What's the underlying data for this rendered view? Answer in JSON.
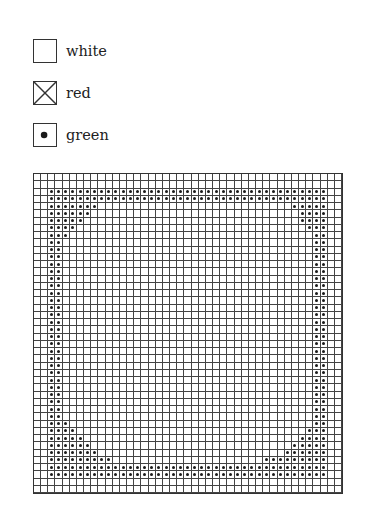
{
  "legend": {
    "items": [
      {
        "key": "white",
        "label": "white",
        "symbol": "empty"
      },
      {
        "key": "red",
        "label": "red",
        "symbol": "cross"
      },
      {
        "key": "green",
        "label": "green",
        "symbol": "dot"
      }
    ]
  },
  "grid": {
    "cols": 43,
    "rows": 44,
    "default_state": "white",
    "green_cells_by_row": {
      "2": [
        [
          2,
          40
        ]
      ],
      "3": [
        [
          2,
          40
        ]
      ],
      "4": [
        [
          2,
          8
        ],
        [
          36,
          40
        ]
      ],
      "5": [
        [
          2,
          7
        ],
        [
          37,
          40
        ]
      ],
      "6": [
        [
          2,
          6
        ],
        [
          37,
          40
        ]
      ],
      "7": [
        [
          2,
          5
        ],
        [
          38,
          40
        ]
      ],
      "8": [
        [
          2,
          4
        ],
        [
          39,
          40
        ]
      ],
      "9": [
        [
          2,
          3
        ],
        [
          39,
          40
        ]
      ],
      "10": [
        [
          2,
          3
        ],
        [
          39,
          40
        ]
      ],
      "11": [
        [
          2,
          3
        ],
        [
          39,
          40
        ]
      ],
      "12": [
        [
          2,
          3
        ],
        [
          39,
          40
        ]
      ],
      "13": [
        [
          2,
          3
        ],
        [
          39,
          40
        ]
      ],
      "14": [
        [
          2,
          3
        ],
        [
          39,
          40
        ]
      ],
      "15": [
        [
          2,
          3
        ],
        [
          39,
          40
        ]
      ],
      "16": [
        [
          2,
          3
        ],
        [
          39,
          40
        ]
      ],
      "17": [
        [
          2,
          3
        ],
        [
          39,
          40
        ]
      ],
      "18": [
        [
          2,
          3
        ],
        [
          39,
          40
        ]
      ],
      "19": [
        [
          2,
          3
        ],
        [
          39,
          40
        ]
      ],
      "20": [
        [
          2,
          3
        ],
        [
          39,
          40
        ]
      ],
      "21": [
        [
          2,
          3
        ],
        [
          39,
          40
        ]
      ],
      "22": [
        [
          2,
          3
        ],
        [
          39,
          40
        ]
      ],
      "23": [
        [
          2,
          3
        ],
        [
          39,
          40
        ]
      ],
      "24": [
        [
          2,
          3
        ],
        [
          39,
          40
        ]
      ],
      "25": [
        [
          2,
          3
        ],
        [
          39,
          40
        ]
      ],
      "26": [
        [
          2,
          3
        ],
        [
          39,
          40
        ]
      ],
      "27": [
        [
          2,
          3
        ],
        [
          39,
          40
        ]
      ],
      "28": [
        [
          2,
          3
        ],
        [
          39,
          40
        ]
      ],
      "29": [
        [
          2,
          3
        ],
        [
          39,
          40
        ]
      ],
      "30": [
        [
          2,
          3
        ],
        [
          39,
          40
        ]
      ],
      "31": [
        [
          2,
          3
        ],
        [
          39,
          40
        ]
      ],
      "32": [
        [
          2,
          3
        ],
        [
          39,
          40
        ]
      ],
      "33": [
        [
          2,
          3
        ],
        [
          39,
          40
        ]
      ],
      "34": [
        [
          2,
          4
        ],
        [
          39,
          40
        ]
      ],
      "35": [
        [
          2,
          5
        ],
        [
          38,
          40
        ]
      ],
      "36": [
        [
          2,
          6
        ],
        [
          37,
          40
        ]
      ],
      "37": [
        [
          2,
          7
        ],
        [
          36,
          40
        ]
      ],
      "38": [
        [
          2,
          8
        ],
        [
          35,
          40
        ]
      ],
      "39": [
        [
          2,
          10
        ],
        [
          32,
          40
        ]
      ],
      "40": [
        [
          2,
          40
        ]
      ],
      "41": [
        [
          2,
          40
        ]
      ]
    }
  }
}
